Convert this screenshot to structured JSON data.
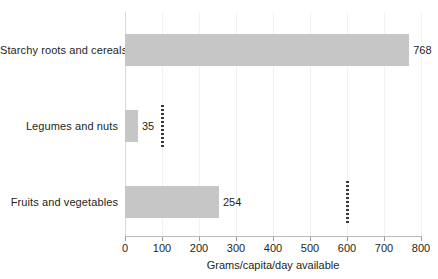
{
  "chart_data": {
    "type": "bar",
    "orientation": "horizontal",
    "title": "",
    "subtitle": "",
    "categories": [
      "Starchy roots and cereals",
      "Legumes and nuts",
      "Fruits and vegetables"
    ],
    "values": [
      768,
      35,
      254
    ],
    "value_labels": [
      "768",
      "35",
      "254"
    ],
    "xlabel": "Grams/capita/day available",
    "ylabel": "",
    "xlim": [
      0,
      800
    ],
    "xticks": [
      0,
      100,
      200,
      300,
      400,
      500,
      600,
      700,
      800
    ],
    "xtick_labels": [
      "0",
      "100",
      "200",
      "300",
      "400",
      "500",
      "600",
      "700",
      "800"
    ],
    "grid": true,
    "grid_axis": "x",
    "legend": false,
    "annotations": [
      {
        "name": "reference-marker-legumes",
        "category": "Legumes and nuts",
        "x": 100,
        "style": "dotted-vertical"
      },
      {
        "name": "reference-marker-fruits",
        "category": "Fruits and vegetables",
        "x": 600,
        "style": "dotted-vertical"
      }
    ],
    "colors": {
      "bar_fill": "#c6c6c6",
      "background": "#ffffff",
      "text": "#231f20",
      "gridline": "#f2f2f2",
      "axis_line": "#b9b9b9",
      "marker": "#3a3a3a"
    }
  }
}
